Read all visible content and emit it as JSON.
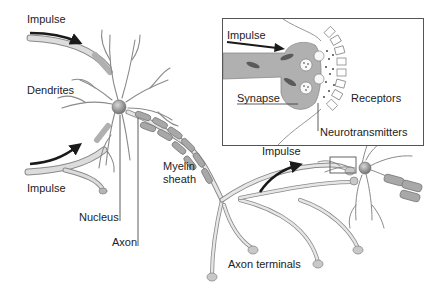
{
  "labels": {
    "impulse_top": "Impulse",
    "dendrites": "Dendrites",
    "impulse_bottom": "Impulse",
    "nucleus": "Nucleus",
    "axon": "Axon",
    "myelin_sheath_line1": "Myelin",
    "myelin_sheath_line2": "sheath",
    "impulse_right": "Impulse",
    "axon_terminals": "Axon terminals"
  },
  "inset": {
    "impulse": "Impulse",
    "synapse": "Synapse",
    "receptors": "Receptors",
    "neurotransmitters": "Neurotransmitters"
  },
  "colors": {
    "neuron_fill": "#e6e6e6",
    "neuron_stroke": "#8a8a8a",
    "dendrite_dark": "#b5b5b5",
    "myelin": "#9a9a9a",
    "nucleus": "#8f8f8f",
    "arrow": "#1a1a1a",
    "text": "#222222"
  }
}
